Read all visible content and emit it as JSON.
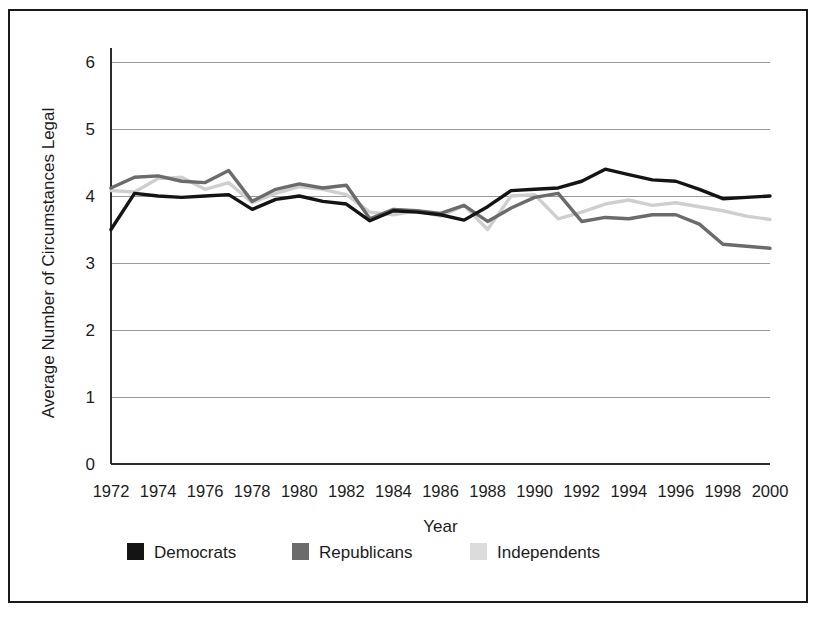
{
  "figure": {
    "border_color": "#1a1a1a",
    "background": "#ffffff"
  },
  "chart_data": {
    "type": "line",
    "title": "",
    "xlabel": "Year",
    "ylabel": "Average Number of Circumstances Legal",
    "xlim": [
      1972,
      2000
    ],
    "ylim": [
      0,
      6
    ],
    "ytick_labels": [
      "0",
      "1",
      "2",
      "3",
      "4",
      "5",
      "6"
    ],
    "yticks": [
      0,
      1,
      2,
      3,
      4,
      5,
      6
    ],
    "xtick_labels": [
      "1972",
      "1974",
      "1976",
      "1978",
      "1980",
      "1982",
      "1984",
      "1986",
      "1988",
      "1990",
      "1992",
      "1994",
      "1996",
      "1998",
      "2000"
    ],
    "xticks": [
      1972,
      1974,
      1976,
      1978,
      1980,
      1982,
      1984,
      1986,
      1988,
      1990,
      1992,
      1994,
      1996,
      1998,
      2000
    ],
    "grid": "horizontal",
    "legend_position": "below",
    "x": [
      1972,
      1973,
      1974,
      1975,
      1976,
      1977,
      1978,
      1979,
      1980,
      1981,
      1982,
      1983,
      1984,
      1985,
      1986,
      1987,
      1988,
      1989,
      1990,
      1991,
      1992,
      1993,
      1994,
      1995,
      1996,
      1997,
      1998,
      1999,
      2000
    ],
    "series": [
      {
        "name": "Democrats",
        "color": "#141414",
        "values": [
          3.5,
          4.04,
          4.0,
          3.98,
          4.0,
          4.02,
          3.8,
          3.95,
          4.0,
          3.92,
          3.88,
          3.63,
          3.78,
          3.76,
          3.72,
          3.64,
          3.84,
          4.08,
          4.1,
          4.12,
          4.22,
          4.4,
          4.32,
          4.24,
          4.22,
          4.1,
          3.96,
          3.98,
          4.0
        ]
      },
      {
        "name": "Republicans",
        "color": "#6b6b6b",
        "values": [
          4.12,
          4.28,
          4.3,
          4.22,
          4.2,
          4.38,
          3.92,
          4.1,
          4.18,
          4.12,
          4.16,
          3.66,
          3.8,
          3.78,
          3.74,
          3.86,
          3.62,
          3.82,
          3.98,
          4.04,
          3.62,
          3.68,
          3.66,
          3.72,
          3.72,
          3.58,
          3.28,
          3.25,
          3.22
        ]
      },
      {
        "name": "Independents",
        "color": "#cfcfcf",
        "values": [
          4.08,
          4.06,
          4.26,
          4.28,
          4.1,
          4.2,
          3.9,
          4.04,
          4.14,
          4.1,
          4.02,
          3.76,
          3.72,
          3.78,
          3.7,
          3.86,
          3.5,
          4.0,
          4.02,
          3.66,
          3.76,
          3.88,
          3.94,
          3.86,
          3.9,
          3.84,
          3.78,
          3.7,
          3.65
        ]
      }
    ]
  },
  "legend": {
    "items": [
      {
        "label": "Democrats",
        "color": "#141414"
      },
      {
        "label": "Republicans",
        "color": "#6b6b6b"
      },
      {
        "label": "Independents",
        "color": "#dcdcdc"
      }
    ]
  }
}
